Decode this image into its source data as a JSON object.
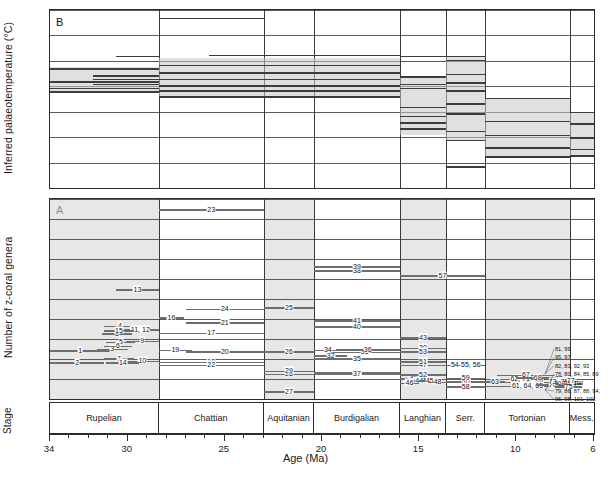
{
  "figure": {
    "xlabel": "Age (Ma)",
    "stage_label": "Stage",
    "panelA": {
      "letter": "A",
      "ylabel": "Number of z-coral genera"
    },
    "panelB": {
      "letter": "B",
      "ylabel": "Inferred  palaeotemperature (°C)"
    }
  },
  "axis": {
    "x": {
      "min": 6,
      "max": 34,
      "reversed": true,
      "major_ticks": [
        30,
        25,
        20,
        15,
        10,
        6
      ],
      "major_labels": [
        "34",
        "30",
        "25",
        "20",
        "15",
        "10",
        "6"
      ],
      "labeled_values": [
        34,
        30,
        25,
        20,
        15,
        10,
        6
      ],
      "minor_step": 1
    },
    "yA": {
      "min": 0,
      "max": 50,
      "step": 5,
      "ticks": [
        "0",
        "5",
        "10",
        "15",
        "20",
        "25",
        "30",
        "35",
        "40",
        "45",
        "50"
      ]
    },
    "yB": {
      "min": 15,
      "max": 22,
      "step": 1,
      "ticks": [
        "15",
        "16",
        "17",
        "18",
        "19",
        "20",
        "21",
        "22"
      ]
    }
  },
  "stages": [
    {
      "name": "Rupelian",
      "start": 34.0,
      "end": 28.4,
      "shaded": true
    },
    {
      "name": "Chattian",
      "start": 28.4,
      "end": 23.0,
      "shaded": false
    },
    {
      "name": "Aquitanian",
      "start": 23.0,
      "end": 20.4,
      "shaded": true
    },
    {
      "name": "Burdigalian",
      "start": 20.4,
      "end": 16.0,
      "shaded": false
    },
    {
      "name": "Langhian",
      "start": 16.0,
      "end": 13.6,
      "shaded": true
    },
    {
      "name": "Serr.",
      "start": 13.6,
      "end": 11.6,
      "shaded": false
    },
    {
      "name": "Tortonian",
      "start": 11.6,
      "end": 7.25,
      "shaded": true
    },
    {
      "name": "Mess.",
      "start": 7.25,
      "end": 6.0,
      "shaded": false
    }
  ],
  "chart_data": {
    "type": "bar",
    "xlabel": "Age (Ma)",
    "panels": [
      {
        "id": "B",
        "type": "bar",
        "ylabel": "Inferred  palaeotemperature (°C)",
        "ylim": [
          15,
          22
        ],
        "xlim": [
          34,
          6
        ],
        "grid": true,
        "description": "Horizontal range bars of inferred palaeotemperature plotted against age; shaded envelope bands span the interquartile spread.",
        "bands": [
          {
            "x_start": 34.0,
            "x_end": 28.4,
            "y_low": 18.75,
            "y_high": 19.75
          },
          {
            "x_start": 28.4,
            "x_end": 16.0,
            "y_low": 18.6,
            "y_high": 20.1
          },
          {
            "x_start": 16.0,
            "x_end": 13.6,
            "y_low": 17.1,
            "y_high": 19.4
          },
          {
            "x_start": 13.6,
            "x_end": 11.6,
            "y_low": 16.9,
            "y_high": 20.2
          },
          {
            "x_start": 11.6,
            "x_end": 7.25,
            "y_low": 16.25,
            "y_high": 18.55
          },
          {
            "x_start": 7.25,
            "x_end": 6.0,
            "y_low": 16.3,
            "y_high": 18.0
          }
        ],
        "bars": [
          {
            "x_start": 28.4,
            "x_end": 23.0,
            "y": 21.7
          },
          {
            "x_start": 30.6,
            "x_end": 28.4,
            "y": 20.2
          },
          {
            "x_start": 25.8,
            "x_end": 16.0,
            "y": 20.25
          },
          {
            "x_start": 16.0,
            "x_end": 11.6,
            "y": 20.2
          },
          {
            "x_start": 13.6,
            "x_end": 11.6,
            "y": 20.05
          },
          {
            "x_start": 34.0,
            "x_end": 28.4,
            "y": 19.72
          },
          {
            "x_start": 31.8,
            "x_end": 28.4,
            "y": 19.45
          },
          {
            "x_start": 31.8,
            "x_end": 28.4,
            "y": 19.3
          },
          {
            "x_start": 34.0,
            "x_end": 28.4,
            "y": 19.2
          },
          {
            "x_start": 31.8,
            "x_end": 28.4,
            "y": 19.1
          },
          {
            "x_start": 34.0,
            "x_end": 28.4,
            "y": 18.95
          },
          {
            "x_start": 34.0,
            "x_end": 28.4,
            "y": 18.8
          },
          {
            "x_start": 28.4,
            "x_end": 16.0,
            "y": 19.85
          },
          {
            "x_start": 28.4,
            "x_end": 16.0,
            "y": 19.55
          },
          {
            "x_start": 28.4,
            "x_end": 16.0,
            "y": 19.3
          },
          {
            "x_start": 28.4,
            "x_end": 16.0,
            "y": 19.05
          },
          {
            "x_start": 28.4,
            "x_end": 16.0,
            "y": 18.85
          },
          {
            "x_start": 28.4,
            "x_end": 16.0,
            "y": 18.62
          },
          {
            "x_start": 16.0,
            "x_end": 13.6,
            "y": 19.4
          },
          {
            "x_start": 16.0,
            "x_end": 13.6,
            "y": 19.1
          },
          {
            "x_start": 16.0,
            "x_end": 13.6,
            "y": 18.95
          },
          {
            "x_start": 16.0,
            "x_end": 13.6,
            "y": 18.2
          },
          {
            "x_start": 16.0,
            "x_end": 13.6,
            "y": 17.85
          },
          {
            "x_start": 16.0,
            "x_end": 13.6,
            "y": 17.6
          },
          {
            "x_start": 16.0,
            "x_end": 13.6,
            "y": 17.35
          },
          {
            "x_start": 13.6,
            "x_end": 11.6,
            "y": 19.5
          },
          {
            "x_start": 13.6,
            "x_end": 11.6,
            "y": 19.15
          },
          {
            "x_start": 13.6,
            "x_end": 11.6,
            "y": 18.85
          },
          {
            "x_start": 13.6,
            "x_end": 11.6,
            "y": 18.35
          },
          {
            "x_start": 13.6,
            "x_end": 11.6,
            "y": 17.95
          },
          {
            "x_start": 13.6,
            "x_end": 11.6,
            "y": 17.25
          },
          {
            "x_start": 13.6,
            "x_end": 11.6,
            "y": 16.9
          },
          {
            "x_start": 11.6,
            "x_end": 7.25,
            "y": 18.55
          },
          {
            "x_start": 11.6,
            "x_end": 7.25,
            "y": 17.65
          },
          {
            "x_start": 11.6,
            "x_end": 7.25,
            "y": 17.1
          },
          {
            "x_start": 11.6,
            "x_end": 7.25,
            "y": 16.6
          },
          {
            "x_start": 11.6,
            "x_end": 7.25,
            "y": 16.25
          },
          {
            "x_start": 7.25,
            "x_end": 6.0,
            "y": 18.0
          },
          {
            "x_start": 7.25,
            "x_end": 6.0,
            "y": 17.55
          },
          {
            "x_start": 7.25,
            "x_end": 6.0,
            "y": 17.0
          },
          {
            "x_start": 7.25,
            "x_end": 6.0,
            "y": 16.55
          },
          {
            "x_start": 7.25,
            "x_end": 6.0,
            "y": 16.3
          },
          {
            "x_start": 13.6,
            "x_end": 11.6,
            "y": 15.85
          }
        ]
      },
      {
        "id": "A",
        "type": "bar",
        "ylabel": "Number of z-coral genera",
        "ylim": [
          0,
          50
        ],
        "xlim": [
          34,
          6
        ],
        "grid": true,
        "description": "Stratigraphic range bars for 102 numbered z-coral faunas; y-position gives generic richness, x-extent gives age range.",
        "bars": [
          {
            "label": "1",
            "x_start": 34.0,
            "x_end": 30.9,
            "y": 12.2
          },
          {
            "label": "2",
            "x_start": 34.0,
            "x_end": 31.2,
            "y": 9.2
          },
          {
            "label": "3",
            "x_start": 31.6,
            "x_end": 30.0,
            "y": 12.6
          },
          {
            "label": "4",
            "x_start": 31.2,
            "x_end": 29.6,
            "y": 18.3
          },
          {
            "label": "5",
            "x_start": 31.1,
            "x_end": 29.6,
            "y": 14.3
          },
          {
            "label": "6",
            "x_start": 31.2,
            "x_end": 29.8,
            "y": 13.3
          },
          {
            "label": "7",
            "x_start": 31.2,
            "x_end": 29.7,
            "y": 10.2
          },
          {
            "label": "8",
            "x_start": 31.3,
            "x_end": 29.8,
            "y": 16.4
          },
          {
            "label": "9",
            "x_start": 30.1,
            "x_end": 28.4,
            "y": 14.6
          },
          {
            "label": "10",
            "x_start": 30.1,
            "x_end": 28.4,
            "y": 9.6
          },
          {
            "label": "11, 12",
            "x_start": 30.3,
            "x_end": 28.4,
            "y": 17.4
          },
          {
            "label": "13",
            "x_start": 30.6,
            "x_end": 28.4,
            "y": 27.4
          },
          {
            "label": "14",
            "x_start": 31.1,
            "x_end": 29.4,
            "y": 9.2
          },
          {
            "label": "15",
            "x_start": 31.2,
            "x_end": 29.7,
            "y": 17.2
          },
          {
            "label": "16",
            "x_start": 28.4,
            "x_end": 27.1,
            "y": 20.4
          },
          {
            "label": "17",
            "x_start": 28.4,
            "x_end": 23.0,
            "y": 16.6
          },
          {
            "label": "18",
            "x_start": 28.4,
            "x_end": 23.0,
            "y": 9.3
          },
          {
            "label": "19",
            "x_start": 28.4,
            "x_end": 26.7,
            "y": 12.3
          },
          {
            "label": "20",
            "x_start": 27.0,
            "x_end": 23.0,
            "y": 11.9
          },
          {
            "label": "21",
            "x_start": 27.0,
            "x_end": 23.0,
            "y": 19.2
          },
          {
            "label": "22",
            "x_start": 28.4,
            "x_end": 23.0,
            "y": 8.6
          },
          {
            "label": "23",
            "x_start": 28.4,
            "x_end": 23.0,
            "y": 47.5
          },
          {
            "label": "24",
            "x_start": 27.0,
            "x_end": 23.0,
            "y": 22.6
          },
          {
            "label": "25",
            "x_start": 23.0,
            "x_end": 20.4,
            "y": 23.0
          },
          {
            "label": "26",
            "x_start": 23.0,
            "x_end": 20.4,
            "y": 12.0
          },
          {
            "label": "27",
            "x_start": 23.0,
            "x_end": 20.4,
            "y": 2.0
          },
          {
            "label": "28",
            "x_start": 23.0,
            "x_end": 20.4,
            "y": 6.3
          },
          {
            "label": "29",
            "x_start": 23.0,
            "x_end": 20.4,
            "y": 7.1
          },
          {
            "label": "30",
            "x_start": 16.0,
            "x_end": 13.6,
            "y": 12.8
          },
          {
            "label": "31",
            "x_start": 20.4,
            "x_end": 16.0,
            "y": 6.7
          },
          {
            "label": "32",
            "x_start": 20.4,
            "x_end": 18.7,
            "y": 11.0
          },
          {
            "label": "33",
            "x_start": 19.6,
            "x_end": 16.0,
            "y": 11.8
          },
          {
            "label": "34",
            "x_start": 20.4,
            "x_end": 19.0,
            "y": 12.3
          },
          {
            "label": "35",
            "x_start": 20.4,
            "x_end": 16.0,
            "y": 10.2
          },
          {
            "label": "36",
            "x_start": 19.3,
            "x_end": 16.0,
            "y": 12.4
          },
          {
            "label": "37",
            "x_start": 20.4,
            "x_end": 16.0,
            "y": 6.3
          },
          {
            "label": "38",
            "x_start": 20.4,
            "x_end": 16.0,
            "y": 32.2
          },
          {
            "label": "39",
            "x_start": 20.4,
            "x_end": 16.0,
            "y": 33.2
          },
          {
            "label": "40",
            "x_start": 20.4,
            "x_end": 16.0,
            "y": 18.2
          },
          {
            "label": "41",
            "x_start": 20.4,
            "x_end": 16.0,
            "y": 19.7
          },
          {
            "label": "42",
            "x_start": 16.0,
            "x_end": 14.6,
            "y": 5.2
          },
          {
            "label": "43",
            "x_start": 16.0,
            "x_end": 13.6,
            "y": 15.5
          },
          {
            "label": "44",
            "x_start": 15.6,
            "x_end": 14.4,
            "y": 4.6
          },
          {
            "label": "45",
            "x_start": 15.0,
            "x_end": 13.9,
            "y": 4.7
          },
          {
            "label": "46",
            "x_start": 16.0,
            "x_end": 15.0,
            "y": 4.1
          },
          {
            "label": "47",
            "x_start": 16.0,
            "x_end": 13.6,
            "y": 8.6
          },
          {
            "label": "48",
            "x_start": 14.5,
            "x_end": 13.6,
            "y": 4.3
          },
          {
            "label": "49",
            "x_start": 13.6,
            "x_end": 11.6,
            "y": 4.6
          },
          {
            "label": "50",
            "x_start": 13.6,
            "x_end": 11.6,
            "y": 4.5
          },
          {
            "label": "52",
            "x_start": 16.0,
            "x_end": 13.6,
            "y": 6.2
          },
          {
            "label": "53",
            "x_start": 16.0,
            "x_end": 13.6,
            "y": 11.9
          },
          {
            "label": "54-55, 56",
            "x_start": 13.6,
            "x_end": 11.6,
            "y": 8.6
          },
          {
            "label": "57",
            "x_start": 16.0,
            "x_end": 11.6,
            "y": 31.0
          },
          {
            "label": "58",
            "x_start": 13.6,
            "x_end": 11.6,
            "y": 3.2
          },
          {
            "label": "59",
            "x_start": 13.6,
            "x_end": 11.6,
            "y": 5.3
          },
          {
            "label": "60, 66, 69",
            "x_start": 11.6,
            "x_end": 7.25,
            "y": 4.3
          },
          {
            "label": "61, 64, 65",
            "x_start": 11.6,
            "x_end": 7.25,
            "y": 3.3
          },
          {
            "label": "62, 71",
            "x_start": 11.0,
            "x_end": 8.6,
            "y": 5.1
          },
          {
            "label": "63",
            "x_start": 11.6,
            "x_end": 10.6,
            "y": 4.4
          },
          {
            "label": "67",
            "x_start": 11.0,
            "x_end": 8.0,
            "y": 6.1
          },
          {
            "label": "68",
            "x_start": 10.0,
            "x_end": 7.8,
            "y": 5.4
          },
          {
            "label": "70",
            "x_start": 9.0,
            "x_end": 7.25,
            "y": 3.7
          },
          {
            "label": "72",
            "x_start": 8.4,
            "x_end": 7.25,
            "y": 5.2
          },
          {
            "label": "73, 76",
            "x_start": 8.4,
            "x_end": 7.25,
            "y": 4.3
          },
          {
            "label": "74",
            "x_start": 7.6,
            "x_end": 6.6,
            "y": 4.0
          },
          {
            "label": "75",
            "x_start": 8.0,
            "x_end": 6.6,
            "y": 3.2
          },
          {
            "label": "77",
            "x_start": 7.6,
            "x_end": 6.8,
            "y": 4.6
          },
          {
            "label": "51",
            "x_start": 16.0,
            "x_end": 13.6,
            "y": 9.4
          }
        ]
      }
    ],
    "right_legend": [
      {
        "label": "81, 99",
        "y": 9.3
      },
      {
        "label": "95, 97",
        "y": 7.7
      },
      {
        "label": "82, 83, 92, 93",
        "y": 6.2
      },
      {
        "label": "78, 80, 84, 85, 89",
        "y": 4.8
      },
      {
        "label": "90, 91, 100",
        "y": 4.0
      },
      {
        "label": "79, 86, 87, 88, 94,",
        "y": 2.6
      },
      {
        "label": "96, 98, 101, 102",
        "y": 1.8
      }
    ]
  }
}
